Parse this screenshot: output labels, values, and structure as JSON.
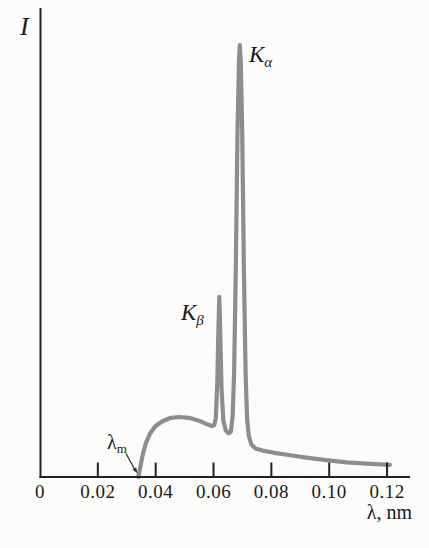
{
  "chart_data": {
    "type": "line",
    "xlabel": "λ, nm",
    "ylabel": "I",
    "xlim": [
      0,
      0.128
    ],
    "ylim": [
      0,
      1.05
    ],
    "grid": false,
    "legend": null,
    "x_ticks": [
      {
        "label": "0",
        "value": 0
      },
      {
        "label": "0.02",
        "value": 0.02
      },
      {
        "label": "0.04",
        "value": 0.04
      },
      {
        "label": "0.06",
        "value": 0.06
      },
      {
        "label": "0.08",
        "value": 0.08
      },
      {
        "label": "0.10",
        "value": 0.1
      },
      {
        "label": "0.12",
        "value": 0.12
      }
    ],
    "curve_color": "#8d8d8d",
    "axis_color": "#222222",
    "series": [
      {
        "points": [
          [
            0.034,
            0.0
          ],
          [
            0.0346,
            0.02
          ],
          [
            0.0354,
            0.048
          ],
          [
            0.0366,
            0.078
          ],
          [
            0.038,
            0.1
          ],
          [
            0.0398,
            0.117
          ],
          [
            0.042,
            0.128
          ],
          [
            0.0448,
            0.136
          ],
          [
            0.048,
            0.139
          ],
          [
            0.0515,
            0.137
          ],
          [
            0.055,
            0.13
          ],
          [
            0.0575,
            0.123
          ],
          [
            0.0593,
            0.118
          ],
          [
            0.0602,
            0.12
          ],
          [
            0.0608,
            0.135
          ],
          [
            0.0613,
            0.22
          ],
          [
            0.0617,
            0.34
          ],
          [
            0.062,
            0.417
          ],
          [
            0.0623,
            0.34
          ],
          [
            0.0628,
            0.2
          ],
          [
            0.0634,
            0.13
          ],
          [
            0.0642,
            0.108
          ],
          [
            0.0652,
            0.101
          ],
          [
            0.066,
            0.105
          ],
          [
            0.0666,
            0.14
          ],
          [
            0.0671,
            0.24
          ],
          [
            0.0677,
            0.48
          ],
          [
            0.0683,
            0.8
          ],
          [
            0.0688,
            0.965
          ],
          [
            0.0691,
            1.0
          ],
          [
            0.0694,
            0.965
          ],
          [
            0.0699,
            0.8
          ],
          [
            0.0705,
            0.48
          ],
          [
            0.0711,
            0.24
          ],
          [
            0.0716,
            0.135
          ],
          [
            0.0722,
            0.095
          ],
          [
            0.0731,
            0.075
          ],
          [
            0.0745,
            0.066
          ],
          [
            0.077,
            0.061
          ],
          [
            0.081,
            0.056
          ],
          [
            0.086,
            0.051
          ],
          [
            0.092,
            0.045
          ],
          [
            0.099,
            0.039
          ],
          [
            0.106,
            0.034
          ],
          [
            0.113,
            0.031
          ],
          [
            0.121,
            0.028
          ]
        ]
      }
    ],
    "annotations": [
      {
        "id": "k-alpha",
        "symbol": "K",
        "subscript": "α",
        "x": 0.0691,
        "y": 1.0
      },
      {
        "id": "k-beta",
        "symbol": "K",
        "subscript": "β",
        "x": 0.062,
        "y": 0.417
      },
      {
        "id": "lambda-m",
        "symbol": "λ",
        "subscript": "m",
        "x": 0.034,
        "y": 0.0
      }
    ]
  }
}
